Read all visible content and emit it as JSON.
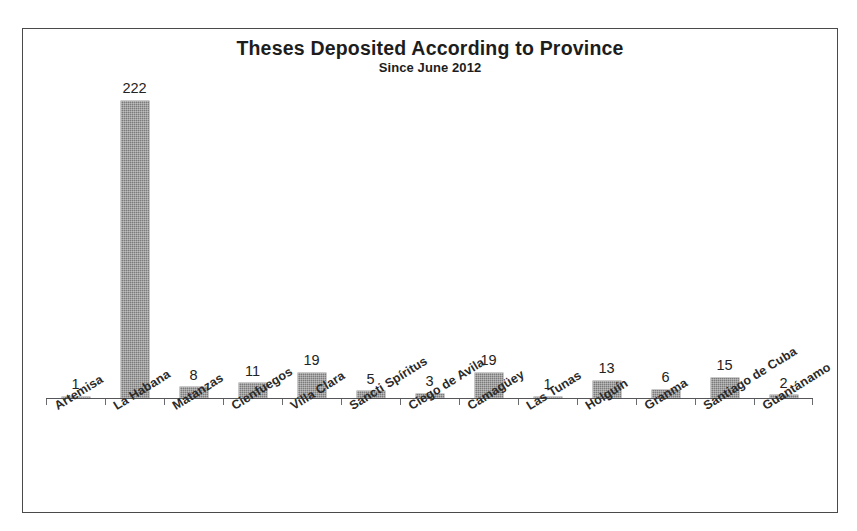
{
  "scan_bleed_text": "·  ·   ·",
  "chart_data": {
    "type": "bar",
    "title": "Theses Deposited According to Province",
    "subtitle": "Since June 2012",
    "xlabel": "",
    "ylabel": "",
    "ylim": [
      0,
      245
    ],
    "grid": false,
    "legend": "none",
    "orientation": "vertical",
    "bar_color": "#7b7b7b",
    "axis_color": "#55565a",
    "categories": [
      "Artemisa",
      "La Habana",
      "Matanzas",
      "Cienfuegos",
      "Villa Clara",
      "Sancti Spíritus",
      "Ciego de Avila",
      "Camagüey",
      "Las Tunas",
      "Holguín",
      "Granma",
      "Santiago de Cuba",
      "Guantánamo"
    ],
    "values": [
      1,
      222,
      8,
      11,
      19,
      5,
      3,
      19,
      1,
      13,
      6,
      15,
      2
    ],
    "data_labels": [
      "1",
      "222",
      "8",
      "11",
      "19",
      "5",
      "3",
      "19",
      "1",
      "13",
      "6",
      "15",
      "2"
    ]
  }
}
